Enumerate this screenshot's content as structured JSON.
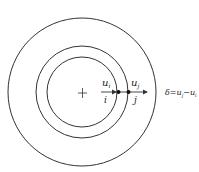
{
  "diagram": {
    "type": "concentric-circles",
    "center_mark": "+",
    "circles": [
      {
        "name": "inner",
        "r": 34
      },
      {
        "name": "middle",
        "r": 46
      },
      {
        "name": "outer",
        "r": 74
      }
    ],
    "points": [
      {
        "name": "i",
        "var": "u",
        "sub": "i"
      },
      {
        "name": "j",
        "var": "u",
        "sub": "j"
      }
    ],
    "formula": {
      "lhs": "δ",
      "eq": "=",
      "t1": "u",
      "t1_sub": "j",
      "minus": "−",
      "t2": "u",
      "t2_sub": "i"
    },
    "colors": {
      "stroke": "#333333",
      "background": "#ffffff"
    }
  }
}
